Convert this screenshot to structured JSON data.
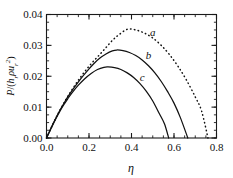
{
  "chart_data": {
    "type": "line",
    "title": "",
    "xlabel": "η",
    "ylabel": "P/(hᵣρuᵣ²)",
    "xlim": [
      0.0,
      0.8
    ],
    "ylim": [
      0.0,
      0.04
    ],
    "grid": false,
    "legend": "inline-curve-labels",
    "xticks": [
      "0.0",
      "0.2",
      "0.4",
      "0.6",
      "0.8"
    ],
    "xtick_values": [
      0.0,
      0.2,
      0.4,
      0.6,
      0.8
    ],
    "yticks": [
      "0.00",
      "0.01",
      "0.02",
      "0.03",
      "0.04"
    ],
    "ytick_values": [
      0.0,
      0.01,
      0.02,
      0.03,
      0.04
    ],
    "xminor_step": 0.05,
    "yminor_step": 0.0025,
    "series": [
      {
        "name": "a",
        "label": "a",
        "style": "dotted",
        "color": "#111111",
        "peak_x": 0.38,
        "peak_y": 0.0352,
        "zero_x": 0.76,
        "x": [
          0.0,
          0.02,
          0.04,
          0.06,
          0.08,
          0.1,
          0.13,
          0.16,
          0.19,
          0.22,
          0.25,
          0.28,
          0.31,
          0.34,
          0.38,
          0.42,
          0.46,
          0.5,
          0.54,
          0.58,
          0.62,
          0.66,
          0.7,
          0.73,
          0.76
        ],
        "y": [
          0.0,
          0.003,
          0.0059,
          0.0086,
          0.0111,
          0.0135,
          0.0167,
          0.0197,
          0.0224,
          0.0248,
          0.027,
          0.0293,
          0.0316,
          0.0334,
          0.0352,
          0.035,
          0.034,
          0.0324,
          0.03,
          0.0269,
          0.0231,
          0.0186,
          0.0133,
          0.0087,
          0.0
        ]
      },
      {
        "name": "b",
        "label": "b",
        "style": "solid",
        "color": "#111111",
        "peak_x": 0.33,
        "peak_y": 0.0285,
        "zero_x": 0.665,
        "x": [
          0.0,
          0.02,
          0.04,
          0.06,
          0.08,
          0.1,
          0.13,
          0.16,
          0.19,
          0.22,
          0.25,
          0.28,
          0.31,
          0.33,
          0.36,
          0.39,
          0.42,
          0.45,
          0.48,
          0.51,
          0.54,
          0.57,
          0.6,
          0.63,
          0.665
        ],
        "y": [
          0.0,
          0.003,
          0.0059,
          0.0086,
          0.011,
          0.0133,
          0.0163,
          0.0191,
          0.0216,
          0.0239,
          0.0258,
          0.0272,
          0.0282,
          0.0285,
          0.0283,
          0.0277,
          0.0267,
          0.0253,
          0.0234,
          0.0211,
          0.0183,
          0.015,
          0.0113,
          0.0066,
          0.0
        ]
      },
      {
        "name": "c",
        "label": "c",
        "style": "solid",
        "color": "#111111",
        "peak_x": 0.29,
        "peak_y": 0.023,
        "zero_x": 0.575,
        "x": [
          0.0,
          0.02,
          0.04,
          0.06,
          0.08,
          0.1,
          0.12,
          0.15,
          0.18,
          0.21,
          0.24,
          0.27,
          0.29,
          0.32,
          0.35,
          0.38,
          0.41,
          0.44,
          0.47,
          0.5,
          0.53,
          0.555,
          0.575
        ],
        "y": [
          0.0,
          0.0029,
          0.0057,
          0.0083,
          0.0106,
          0.0127,
          0.0146,
          0.0171,
          0.0192,
          0.0209,
          0.0222,
          0.0229,
          0.023,
          0.0228,
          0.0222,
          0.0211,
          0.0196,
          0.0176,
          0.0151,
          0.012,
          0.008,
          0.0046,
          0.0
        ]
      }
    ],
    "annotations": [
      {
        "text": "a",
        "x": 0.5,
        "y": 0.033
      },
      {
        "text": "b",
        "x": 0.48,
        "y": 0.0255
      },
      {
        "text": "c",
        "x": 0.45,
        "y": 0.0185
      }
    ]
  },
  "ylabel_parts": {
    "numerator": "P",
    "slash": "/(",
    "h": "h",
    "h_sub": "r",
    "rho": "ρ",
    "u": "u",
    "u_sub": "r",
    "u_sup": "2",
    "close": ")"
  }
}
